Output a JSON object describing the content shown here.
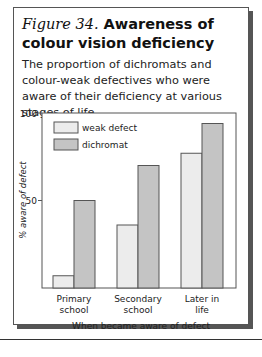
{
  "figure": {
    "label": "Figure 34.",
    "title": "Awareness of colour vision deficiency",
    "subtitle": "The proportion of dichromats and colour-weak defectives who were aware of their deficiency at various stages of life."
  },
  "chart_data": {
    "type": "bar",
    "title": "Awareness of colour vision deficiency",
    "xlabel": "When became aware of defect",
    "ylabel": "% aware of defect",
    "ylim": [
      0,
      100
    ],
    "yticks": [
      50,
      100
    ],
    "grid": false,
    "legend_position": "upper left",
    "categories": [
      "Primary school",
      "Secondary school",
      "Later in life"
    ],
    "category_lines": [
      [
        "Primary",
        "school"
      ],
      [
        "Secondary",
        "school"
      ],
      [
        "Later in",
        "life"
      ]
    ],
    "series": [
      {
        "name": "weak defect",
        "color": "#ececec",
        "values": [
          7,
          36,
          77
        ]
      },
      {
        "name": "dichromat",
        "color": "#c4c4c4",
        "values": [
          50,
          70,
          94
        ]
      }
    ]
  }
}
